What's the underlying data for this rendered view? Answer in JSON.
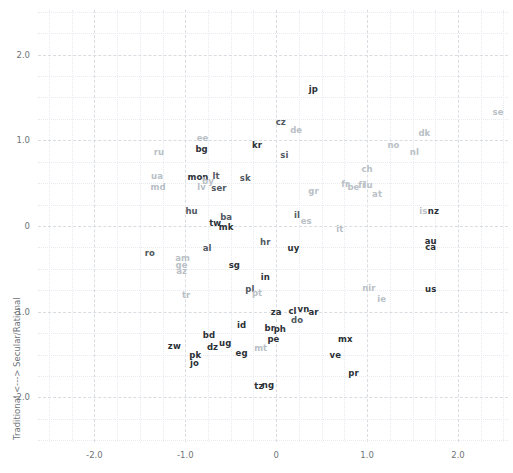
{
  "chart_data": {
    "type": "scatter",
    "title": "",
    "xlabel": "",
    "ylabel": "Traditional <---> Secular/Rational",
    "xlim": [
      -2.62,
      2.55
    ],
    "ylim": [
      -2.52,
      2.52
    ],
    "xticks": [
      "-2.0",
      "-1.0",
      "0",
      "1.0",
      "2.0"
    ],
    "xtickvals": [
      -2,
      -1,
      0,
      1,
      2
    ],
    "yticks": [
      "2.0",
      "1.0",
      "0",
      "-1.0",
      "-2.0"
    ],
    "ytickvals": [
      2,
      1,
      0,
      -1,
      -2
    ],
    "grid": true,
    "legend": "none",
    "marker": "text-label",
    "points": [
      {
        "label": "se",
        "x": 2.44,
        "y": 1.33,
        "weight": "light"
      },
      {
        "label": "jp",
        "x": 0.41,
        "y": 1.6,
        "weight": "bold"
      },
      {
        "label": "cz",
        "x": 0.05,
        "y": 1.21,
        "weight": "normal"
      },
      {
        "label": "de",
        "x": 0.22,
        "y": 1.12,
        "weight": "light"
      },
      {
        "label": "dk",
        "x": 1.63,
        "y": 1.09,
        "weight": "light"
      },
      {
        "label": "ee",
        "x": -0.81,
        "y": 1.03,
        "weight": "light"
      },
      {
        "label": "kr",
        "x": -0.21,
        "y": 0.94,
        "weight": "bold"
      },
      {
        "label": "no",
        "x": 1.29,
        "y": 0.95,
        "weight": "light"
      },
      {
        "label": "bg",
        "x": -0.82,
        "y": 0.9,
        "weight": "bold"
      },
      {
        "label": "nl",
        "x": 1.52,
        "y": 0.86,
        "weight": "light"
      },
      {
        "label": "ru",
        "x": -1.29,
        "y": 0.86,
        "weight": "light"
      },
      {
        "label": "si",
        "x": 0.09,
        "y": 0.83,
        "weight": "normal"
      },
      {
        "label": "ch",
        "x": 1.0,
        "y": 0.66,
        "weight": "light"
      },
      {
        "label": "ua",
        "x": -1.31,
        "y": 0.58,
        "weight": "light"
      },
      {
        "label": "mon",
        "x": -0.86,
        "y": 0.57,
        "weight": "bold"
      },
      {
        "label": "lt",
        "x": -0.66,
        "y": 0.58,
        "weight": "normal"
      },
      {
        "label": "sk",
        "x": -0.34,
        "y": 0.56,
        "weight": "normal"
      },
      {
        "label": "by",
        "x": -0.75,
        "y": 0.53,
        "weight": "light"
      },
      {
        "label": "fr",
        "x": 0.76,
        "y": 0.49,
        "weight": "light"
      },
      {
        "label": "fi",
        "x": 0.94,
        "y": 0.48,
        "weight": "light"
      },
      {
        "label": "lu",
        "x": 1.01,
        "y": 0.48,
        "weight": "light"
      },
      {
        "label": "be",
        "x": 0.85,
        "y": 0.45,
        "weight": "light"
      },
      {
        "label": "md",
        "x": -1.3,
        "y": 0.46,
        "weight": "light"
      },
      {
        "label": "lv",
        "x": -0.82,
        "y": 0.45,
        "weight": "light"
      },
      {
        "label": "ser",
        "x": -0.63,
        "y": 0.44,
        "weight": "normal"
      },
      {
        "label": "gr",
        "x": 0.41,
        "y": 0.41,
        "weight": "light"
      },
      {
        "label": "at",
        "x": 1.11,
        "y": 0.37,
        "weight": "light"
      },
      {
        "label": "is",
        "x": 1.62,
        "y": 0.18,
        "weight": "light"
      },
      {
        "label": "nz",
        "x": 1.73,
        "y": 0.17,
        "weight": "bold"
      },
      {
        "label": "hu",
        "x": -0.93,
        "y": 0.17,
        "weight": "normal"
      },
      {
        "label": "il",
        "x": 0.23,
        "y": 0.13,
        "weight": "normal"
      },
      {
        "label": "ba",
        "x": -0.55,
        "y": 0.1,
        "weight": "normal"
      },
      {
        "label": "es",
        "x": 0.33,
        "y": 0.06,
        "weight": "light"
      },
      {
        "label": "tw",
        "x": -0.67,
        "y": 0.03,
        "weight": "bold"
      },
      {
        "label": "mk",
        "x": -0.55,
        "y": -0.01,
        "weight": "bold"
      },
      {
        "label": "it",
        "x": 0.7,
        "y": -0.03,
        "weight": "light"
      },
      {
        "label": "au",
        "x": 1.7,
        "y": -0.17,
        "weight": "bold"
      },
      {
        "label": "hr",
        "x": -0.12,
        "y": -0.19,
        "weight": "normal"
      },
      {
        "label": "uy",
        "x": 0.19,
        "y": -0.26,
        "weight": "bold"
      },
      {
        "label": "ca",
        "x": 1.7,
        "y": -0.25,
        "weight": "bold"
      },
      {
        "label": "al",
        "x": -0.76,
        "y": -0.26,
        "weight": "normal"
      },
      {
        "label": "ro",
        "x": -1.39,
        "y": -0.32,
        "weight": "normal"
      },
      {
        "label": "am",
        "x": -1.03,
        "y": -0.37,
        "weight": "light"
      },
      {
        "label": "ge",
        "x": -1.04,
        "y": -0.45,
        "weight": "light"
      },
      {
        "label": "sg",
        "x": -0.46,
        "y": -0.46,
        "weight": "bold"
      },
      {
        "label": "az",
        "x": -1.04,
        "y": -0.53,
        "weight": "light"
      },
      {
        "label": "in",
        "x": -0.12,
        "y": -0.59,
        "weight": "bold"
      },
      {
        "label": "pl",
        "x": -0.29,
        "y": -0.73,
        "weight": "normal"
      },
      {
        "label": "nir",
        "x": 1.02,
        "y": -0.72,
        "weight": "light"
      },
      {
        "label": "us",
        "x": 1.7,
        "y": -0.73,
        "weight": "bold"
      },
      {
        "label": "pt",
        "x": -0.21,
        "y": -0.78,
        "weight": "light"
      },
      {
        "label": "tr",
        "x": -0.99,
        "y": -0.81,
        "weight": "light"
      },
      {
        "label": "ie",
        "x": 1.16,
        "y": -0.85,
        "weight": "light"
      },
      {
        "label": "za",
        "x": 0.0,
        "y": -1.0,
        "weight": "bold"
      },
      {
        "label": "cl",
        "x": 0.18,
        "y": -0.99,
        "weight": "bold"
      },
      {
        "label": "vn",
        "x": 0.3,
        "y": -0.97,
        "weight": "bold"
      },
      {
        "label": "ar",
        "x": 0.41,
        "y": -1.0,
        "weight": "bold"
      },
      {
        "label": "do",
        "x": 0.23,
        "y": -1.1,
        "weight": "normal"
      },
      {
        "label": "id",
        "x": -0.38,
        "y": -1.16,
        "weight": "bold"
      },
      {
        "label": "br",
        "x": -0.07,
        "y": -1.19,
        "weight": "bold"
      },
      {
        "label": "ph",
        "x": 0.04,
        "y": -1.2,
        "weight": "bold"
      },
      {
        "label": "bd",
        "x": -0.74,
        "y": -1.27,
        "weight": "bold"
      },
      {
        "label": "pe",
        "x": -0.03,
        "y": -1.32,
        "weight": "bold"
      },
      {
        "label": "mx",
        "x": 0.76,
        "y": -1.32,
        "weight": "bold"
      },
      {
        "label": "ug",
        "x": -0.56,
        "y": -1.37,
        "weight": "bold"
      },
      {
        "label": "dz",
        "x": -0.7,
        "y": -1.41,
        "weight": "bold"
      },
      {
        "label": "zw",
        "x": -1.12,
        "y": -1.4,
        "weight": "bold"
      },
      {
        "label": "mt",
        "x": -0.17,
        "y": -1.42,
        "weight": "light"
      },
      {
        "label": "eg",
        "x": -0.38,
        "y": -1.48,
        "weight": "bold"
      },
      {
        "label": "ve",
        "x": 0.65,
        "y": -1.5,
        "weight": "bold"
      },
      {
        "label": "pk",
        "x": -0.89,
        "y": -1.51,
        "weight": "bold"
      },
      {
        "label": "jo",
        "x": -0.9,
        "y": -1.6,
        "weight": "bold"
      },
      {
        "label": "pr",
        "x": 0.85,
        "y": -1.71,
        "weight": "bold"
      },
      {
        "label": "tz",
        "x": -0.19,
        "y": -1.87,
        "weight": "bold"
      },
      {
        "label": "ng",
        "x": -0.09,
        "y": -1.85,
        "weight": "bold"
      }
    ]
  }
}
